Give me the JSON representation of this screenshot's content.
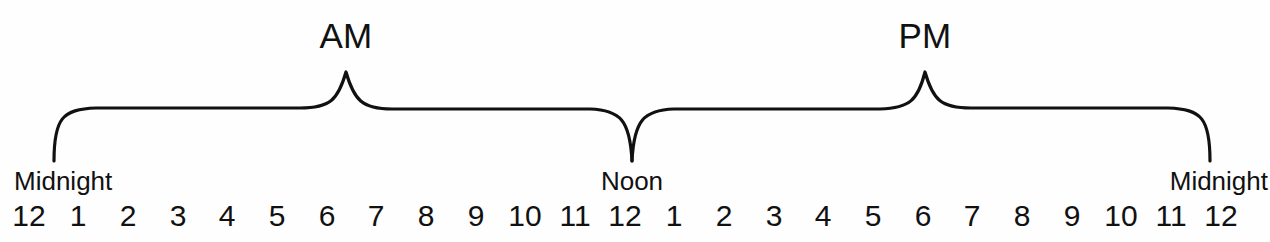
{
  "diagram": {
    "background_color": "#fefefe",
    "stroke_color": "#111111",
    "period_braces": [
      {
        "label": "AM",
        "apex_x": 346,
        "start_x": 54,
        "end_x": 632,
        "label_x": 346,
        "label_y": 18
      },
      {
        "label": "PM",
        "apex_x": 925,
        "start_x": 632,
        "end_x": 1210,
        "label_x": 925,
        "label_y": 18
      }
    ],
    "boundary_labels": [
      {
        "text": "Midnight",
        "x": 14,
        "y": 168,
        "align": "left"
      },
      {
        "text": "Noon",
        "x": 632,
        "y": 168,
        "align": "center"
      },
      {
        "text": "Midnight",
        "x": 1268,
        "y": 168,
        "align": "right"
      }
    ],
    "hours": [
      {
        "value": "12",
        "x": 29
      },
      {
        "value": "1",
        "x": 78
      },
      {
        "value": "2",
        "x": 128
      },
      {
        "value": "3",
        "x": 178
      },
      {
        "value": "4",
        "x": 227
      },
      {
        "value": "5",
        "x": 277
      },
      {
        "value": "6",
        "x": 327
      },
      {
        "value": "7",
        "x": 376
      },
      {
        "value": "8",
        "x": 426
      },
      {
        "value": "9",
        "x": 476
      },
      {
        "value": "10",
        "x": 525
      },
      {
        "value": "11",
        "x": 575
      },
      {
        "value": "12",
        "x": 625
      },
      {
        "value": "1",
        "x": 674
      },
      {
        "value": "2",
        "x": 724
      },
      {
        "value": "3",
        "x": 774
      },
      {
        "value": "4",
        "x": 823
      },
      {
        "value": "5",
        "x": 873
      },
      {
        "value": "6",
        "x": 923
      },
      {
        "value": "7",
        "x": 972
      },
      {
        "value": "8",
        "x": 1022
      },
      {
        "value": "9",
        "x": 1072
      },
      {
        "value": "10",
        "x": 1121
      },
      {
        "value": "11",
        "x": 1171
      },
      {
        "value": "12",
        "x": 1221
      }
    ]
  }
}
